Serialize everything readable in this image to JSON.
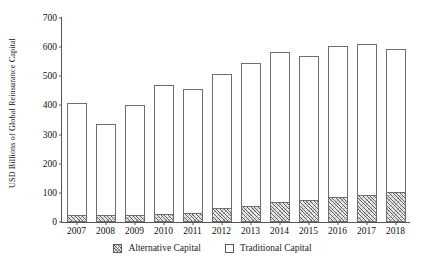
{
  "chart_data": {
    "type": "bar",
    "title": "",
    "subtitle": "",
    "xlabel": "",
    "ylabel": "USD Billions of Global Reinsurance Capital",
    "stacked": true,
    "grid": false,
    "legend_position": "bottom",
    "ylim": [
      0,
      700
    ],
    "ytick_step": 100,
    "yticks": [
      0,
      100,
      200,
      300,
      400,
      500,
      600,
      700
    ],
    "ytick_labels": [
      "0",
      "100",
      "200",
      "300",
      "400",
      "500",
      "600",
      "700"
    ],
    "categories": [
      "2007",
      "2008",
      "2009",
      "2010",
      "2011",
      "2012",
      "2013",
      "2014",
      "2015",
      "2016",
      "2017",
      "2018"
    ],
    "series": [
      {
        "name": "Alternative Capital",
        "style": "hatched",
        "values": [
          22,
          19,
          22,
          24,
          28,
          44,
          50,
          64,
          72,
          81,
          89,
          98
        ]
      },
      {
        "name": "Traditional Capital",
        "style": "open",
        "values": [
          388,
          319,
          378,
          446,
          427,
          464,
          495,
          518,
          498,
          524,
          523,
          497
        ]
      }
    ],
    "totals": [
      410,
      338,
      400,
      470,
      455,
      508,
      545,
      582,
      570,
      605,
      612,
      595
    ]
  },
  "legend": {
    "items": [
      {
        "label": "Alternative Capital",
        "marker": "hatched-square-icon"
      },
      {
        "label": "Traditional Capital",
        "marker": "open-square-icon"
      }
    ]
  },
  "colors": {
    "axis": "#555555",
    "bar_outline": "#6e6e6e",
    "bar_fill": "#ffffff",
    "alt_fill": "#e9e9e9",
    "text": "#111111",
    "background": "#ffffff"
  }
}
